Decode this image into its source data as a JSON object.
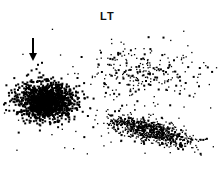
{
  "chart_data": {
    "type": "scatter",
    "title": "LT",
    "xlabel": "",
    "ylabel": "",
    "axes_visible": false,
    "grid": false,
    "legend": null,
    "annotations": [
      {
        "type": "arrow",
        "direction": "down",
        "points_to": "dense left cluster",
        "x": 33,
        "y": 40
      }
    ],
    "populations": [
      {
        "name": "dense left cluster",
        "center": [
          45,
          100
        ],
        "spread": [
          28,
          18
        ],
        "count": 1400,
        "density": "very high"
      },
      {
        "name": "lower right diagonal cluster",
        "center": [
          150,
          130
        ],
        "spread": [
          40,
          12
        ],
        "count": 700,
        "density": "medium",
        "slope": 0.25
      },
      {
        "name": "upper sparse band",
        "center": [
          145,
          70
        ],
        "spread": [
          55,
          22
        ],
        "count": 220,
        "density": "low"
      },
      {
        "name": "background scatter",
        "center": [
          110,
          100
        ],
        "spread": [
          100,
          60
        ],
        "count": 120,
        "density": "very low"
      }
    ],
    "point_color": "#000000",
    "background_color": "#ffffff"
  }
}
